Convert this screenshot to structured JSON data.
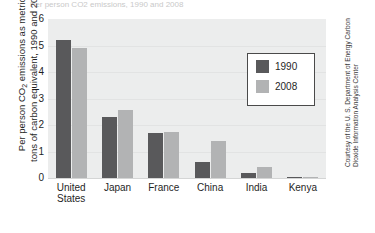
{
  "figure": {
    "top_partial_title": "Per person CO2 emissions, 1990 and 2008",
    "credit_line_1": "Courtesy of the U. S. Department of Energy Carbon",
    "credit_line_2": "Dioxide Information Analysis Center",
    "colors": {
      "bar_1990": "#59595b",
      "bar_2008": "#b2b3b4",
      "plot_background": "#eceded",
      "legend_border": "#4a4a4a",
      "text": "#1f1f1f"
    }
  },
  "axis": {
    "ylabel_line1": "Per person CO",
    "ylabel_sub": "2",
    "ylabel_line1b": " emissions as metric",
    "ylabel_line2": "tons of carbon equivalent, 1990 and 2008",
    "yticks": [
      "6",
      "5",
      "4",
      "3",
      "2",
      "1",
      "0"
    ]
  },
  "legend": {
    "items": [
      {
        "label": "1990",
        "swatch": "dark-gray"
      },
      {
        "label": "2008",
        "swatch": "light-gray"
      }
    ]
  },
  "chart_data": {
    "type": "bar",
    "title": "Per person CO2 emissions as metric tons of carbon equivalent, 1990 and 2008",
    "xlabel": "",
    "ylabel": "Per person CO2 emissions as metric tons of carbon equivalent, 1990 and 2008",
    "ylim": [
      0,
      6
    ],
    "yticks": [
      0,
      1,
      2,
      3,
      4,
      5,
      6
    ],
    "grid": true,
    "legend_position": "upper-right-inside",
    "categories": [
      "United States",
      "Japan",
      "France",
      "China",
      "India",
      "Kenya"
    ],
    "category_lines": [
      [
        "United",
        "States"
      ],
      [
        "Japan"
      ],
      [
        "France"
      ],
      [
        "China"
      ],
      [
        "India"
      ],
      [
        "Kenya"
      ]
    ],
    "series": [
      {
        "name": "1990",
        "color": "#59595b",
        "values": [
          5.2,
          2.3,
          1.7,
          0.6,
          0.2,
          0.05
        ]
      },
      {
        "name": "2008",
        "color": "#b2b3b4",
        "values": [
          4.9,
          2.55,
          1.75,
          1.4,
          0.4,
          0.05
        ]
      }
    ]
  }
}
